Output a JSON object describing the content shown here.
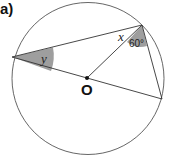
{
  "part_label": "a)",
  "center_label": "O",
  "angles": {
    "x_label": "x",
    "y_label": "y",
    "given_label": "60°"
  },
  "colors": {
    "line": "#333333",
    "circle": "#555555",
    "shade": "#9e9e9e"
  }
}
